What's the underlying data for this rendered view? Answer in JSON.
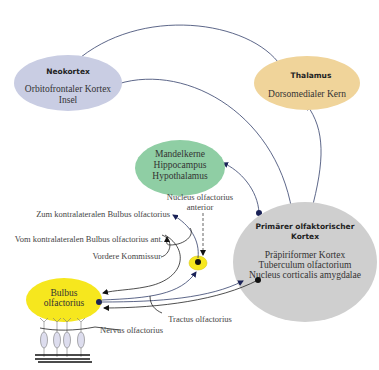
{
  "diagram": {
    "colors": {
      "neokortex": "#c9cde3",
      "thalamus": "#f0d49a",
      "limbic": "#8fcea4",
      "primary": "#cfcfcf",
      "bulbus": "#f6e71e",
      "arrow": "#33406b",
      "dot": "#1a2257"
    },
    "nodes": {
      "neokortex": {
        "title": "Neokortex",
        "line1": "Orbitofrontaler Kortex",
        "line2": "Insel"
      },
      "thalamus": {
        "title": "Thalamus",
        "line1": "Dorsomedialer Kern"
      },
      "limbic": {
        "line1": "Mandelkerne",
        "line2": "Hippocampus",
        "line3": "Hypothalamus"
      },
      "primary": {
        "title1": "Primärer olfaktorischer",
        "title2": "Kortex",
        "line1": "Präpiriformer Kortex",
        "line2": "Tuberculum olfactorium",
        "line3": "Nucleus corticalis amygdalae"
      },
      "bulbus": {
        "line1": "Bulbus",
        "line2": "olfactorius"
      }
    },
    "labels": {
      "nucleus_anterior_1": "Nucleus olfactorius",
      "nucleus_anterior_2": "anterior",
      "zum_kontra": "Zum kontralateralen Bulbus olfactorius",
      "vom_kontra": "Vom kontralateralen Bulbus olfactorius ant.",
      "vordere_kommissur": "Vordere Kommissur",
      "tractus": "Tractus olfactorius",
      "nervus": "Nervus olfactorius"
    }
  }
}
